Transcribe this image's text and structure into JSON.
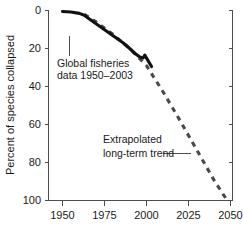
{
  "chart_data": {
    "type": "line",
    "title": "",
    "xlabel": "",
    "ylabel": "Percent of species collapsed",
    "xlim": [
      1950,
      2050
    ],
    "ylim": [
      0,
      100
    ],
    "y_inverted": true,
    "grid": false,
    "legend_position": "none",
    "x_ticks": [
      "1950",
      "1975",
      "2000",
      "2025",
      "2050"
    ],
    "x_tick_values": [
      1950,
      1975,
      2000,
      2025,
      2050
    ],
    "y_ticks": [
      "0",
      "20",
      "40",
      "60",
      "80",
      "100"
    ],
    "y_tick_values": [
      0,
      20,
      40,
      60,
      80,
      100
    ],
    "series": [
      {
        "name": "Global fisheries data 1950-2003",
        "style": "solid",
        "color": "#111111",
        "x": [
          1950,
          1955,
          1960,
          1963,
          1966,
          1970,
          1974,
          1978,
          1982,
          1986,
          1990,
          1993,
          1996,
          1998,
          1999,
          2001,
          2003
        ],
        "values": [
          0.5,
          0.8,
          1.5,
          2.5,
          4.5,
          7.0,
          9.5,
          12.0,
          14.5,
          17.0,
          20.0,
          22.5,
          24.5,
          25.0,
          23.5,
          26.5,
          29.5
        ]
      },
      {
        "name": "Extrapolated long-term trend",
        "style": "dashed",
        "color": "#4a4a4a",
        "x": [
          1963,
          1970,
          1980,
          1990,
          2000,
          2010,
          2020,
          2030,
          2040,
          2048
        ],
        "values": [
          2.0,
          6.0,
          12.5,
          20.0,
          29.0,
          43.0,
          58.0,
          73.5,
          89.0,
          100.0
        ]
      }
    ],
    "annotations": [
      {
        "id": "data-annotation",
        "lines": [
          "Global fisheries",
          "data 1950–2003"
        ],
        "leader": "vertical"
      },
      {
        "id": "trend-annotation",
        "lines": [
          "Extrapolated",
          "long-term trend"
        ],
        "leader": "horizontal"
      }
    ]
  }
}
